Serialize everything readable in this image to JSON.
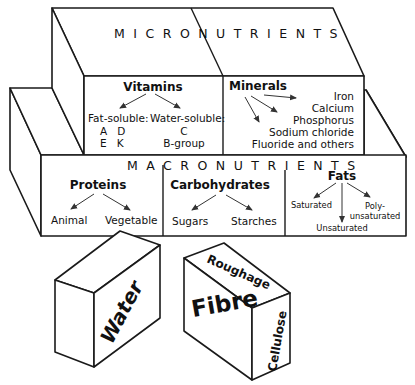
{
  "micronutrients": {
    "title": "MICRONUTRIENTS",
    "vitamins": {
      "heading": "Vitamins",
      "fat_soluble_label": "Fat-soluble:",
      "fat_soluble_row1": "A   D",
      "fat_soluble_row2": "E   K",
      "water_soluble_label": "Water-soluble:",
      "water_soluble_items": [
        "C",
        "B-group"
      ]
    },
    "minerals": {
      "heading": "Minerals",
      "items": [
        "Iron",
        "Calcium",
        "Phosphorus",
        "Sodium chloride",
        "Fluoride and others"
      ]
    }
  },
  "macronutrients": {
    "title": "MACRONUTRIENTS",
    "proteins": {
      "heading": "Proteins",
      "items": [
        "Animal",
        "Vegetable"
      ]
    },
    "carbohydrates": {
      "heading": "Carbohydrates",
      "items": [
        "Sugars",
        "Starches"
      ]
    },
    "fats": {
      "heading": "Fats",
      "saturated": "Saturated",
      "unsaturated": "Unsaturated",
      "poly_line1": "Poly-",
      "poly_line2": "unsaturated"
    }
  },
  "water_block": {
    "label": "Water"
  },
  "fibre_block": {
    "front_label": "Fibre",
    "top_label": "Roughage",
    "side_label": "Cellulose"
  }
}
